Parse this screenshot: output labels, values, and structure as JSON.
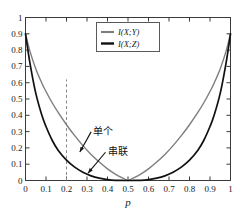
{
  "chart_data": {
    "type": "line",
    "title": "",
    "xlabel": "p",
    "ylabel": "",
    "xlim": [
      0,
      1
    ],
    "ylim": [
      0,
      1
    ],
    "grid": false,
    "legend_position": "upper-center",
    "x_ticks": [
      "0",
      "0.1",
      "0.2",
      "0.3",
      "0.4",
      "0.5",
      "0.6",
      "0.7",
      "0.8",
      "0.9",
      "1"
    ],
    "x_tick_values": [
      0,
      0.1,
      0.2,
      0.3,
      0.4,
      0.5,
      0.6,
      0.7,
      0.8,
      0.9,
      1
    ],
    "y_ticks": [
      "0",
      "0.1",
      "0.2",
      "0.3",
      "0.4",
      "0.5",
      "0.6",
      "0.7",
      "0.8",
      "0.9",
      "1"
    ],
    "y_tick_values": [
      0,
      0.1,
      0.2,
      0.3,
      0.4,
      0.5,
      0.6,
      0.7,
      0.8,
      0.9,
      1
    ],
    "x": [
      0,
      0.02,
      0.05,
      0.08,
      0.1,
      0.13,
      0.16,
      0.2,
      0.24,
      0.28,
      0.32,
      0.36,
      0.4,
      0.44,
      0.48,
      0.5,
      0.52,
      0.56,
      0.6,
      0.64,
      0.68,
      0.72,
      0.76,
      0.8,
      0.84,
      0.87,
      0.9,
      0.92,
      0.95,
      0.98,
      1
    ],
    "series": [
      {
        "name": "I(X;Y)",
        "label": "I(X;Y)",
        "color": "#7d7d7d",
        "annotation": "单个",
        "values": [
          0.9,
          0.8,
          0.686,
          0.597,
          0.546,
          0.477,
          0.416,
          0.342,
          0.275,
          0.214,
          0.16,
          0.113,
          0.0711,
          0.0379,
          0.0115,
          0.0,
          0.0115,
          0.0379,
          0.0711,
          0.113,
          0.16,
          0.214,
          0.275,
          0.342,
          0.416,
          0.477,
          0.546,
          0.597,
          0.686,
          0.8,
          0.9
        ]
      },
      {
        "name": "I(X;Z)",
        "label": "I(X;Z)",
        "color": "#111111",
        "annotation": "串联",
        "values": [
          0.9,
          0.733,
          0.536,
          0.4,
          0.331,
          0.247,
          0.184,
          0.125,
          0.0818,
          0.0504,
          0.0286,
          0.0141,
          0.00539,
          0.00116,
          8e-05,
          0.0,
          8e-05,
          0.00116,
          0.00539,
          0.0141,
          0.0286,
          0.0504,
          0.0818,
          0.125,
          0.184,
          0.247,
          0.331,
          0.4,
          0.536,
          0.733,
          0.9
        ]
      }
    ],
    "annotations": [
      {
        "text": "单个",
        "x": 0.33,
        "y": 0.28,
        "arrow_to_x": 0.265,
        "arrow_to_y": 0.175
      },
      {
        "text": "串联",
        "x": 0.4,
        "y": 0.155,
        "arrow_to_x": 0.305,
        "arrow_to_y": 0.045
      }
    ],
    "reference_lines": [
      {
        "type": "vertical",
        "x": 0.2,
        "y_from": 0.0,
        "y_to": 0.62,
        "style": "dashed",
        "color": "#8a8a8a"
      }
    ]
  },
  "legend": {
    "entries": [
      "I(X;Y)",
      "I(X;Z)"
    ]
  },
  "axes": {
    "x_label": "p"
  }
}
